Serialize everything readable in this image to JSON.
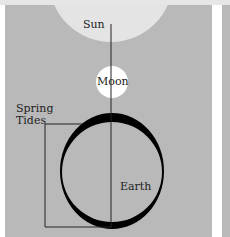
{
  "diagram": {
    "labels": {
      "sun": "Sun",
      "moon": "Moon",
      "earth": "Earth",
      "spring_tides_line1": "Spring",
      "spring_tides_line2": "Tides"
    },
    "colors": {
      "background": "#b9b9b9",
      "sun": "#e4e4e4",
      "moon": "#ffffff",
      "tidal_bulge": "#000000",
      "earth": "#b9b9b9"
    }
  }
}
